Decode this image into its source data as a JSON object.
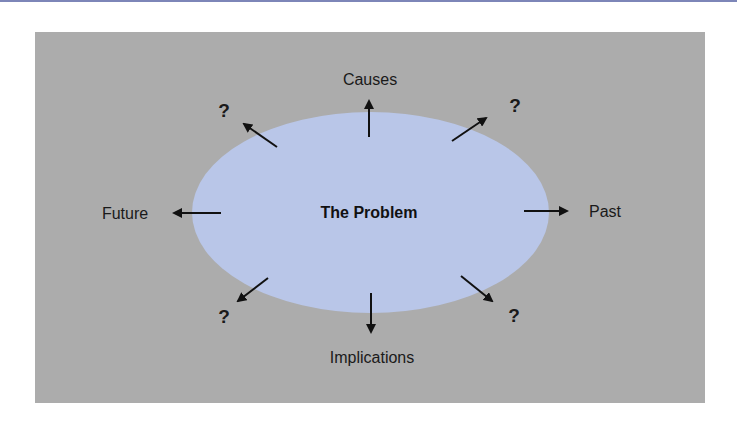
{
  "diagram": {
    "title": "",
    "center": {
      "label": "The Problem"
    },
    "directions": [
      {
        "id": "causes",
        "label": "Causes",
        "direction": "up"
      },
      {
        "id": "past",
        "label": "Past",
        "direction": "right"
      },
      {
        "id": "implications",
        "label": "Implications",
        "direction": "down"
      },
      {
        "id": "future",
        "label": "Future",
        "direction": "left"
      },
      {
        "id": "unknown-top-left",
        "label": "?",
        "direction": "up-left"
      },
      {
        "id": "unknown-top-right",
        "label": "?",
        "direction": "up-right"
      },
      {
        "id": "unknown-bottom-left",
        "label": "?",
        "direction": "down-left"
      },
      {
        "id": "unknown-bottom-right",
        "label": "?",
        "direction": "down-right"
      }
    ]
  },
  "colors": {
    "panel": "#acacac",
    "ellipse": "#b9c6e8",
    "arrow": "#111111",
    "top_rule": "#7d86b8"
  }
}
